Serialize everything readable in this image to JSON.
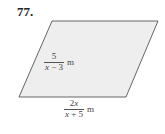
{
  "problem": {
    "number": "77."
  },
  "figure": {
    "shape": "parallelogram",
    "fill_color": "#eeeeee",
    "stroke_color": "#555555",
    "side_label": {
      "numerator": "5",
      "denominator_var": "x",
      "denominator_rest": " − 3",
      "unit": "m"
    },
    "base_label": {
      "numerator_coef": "2",
      "numerator_var": "x",
      "denominator_var": "x",
      "denominator_rest": " + 5",
      "unit": "m"
    }
  }
}
